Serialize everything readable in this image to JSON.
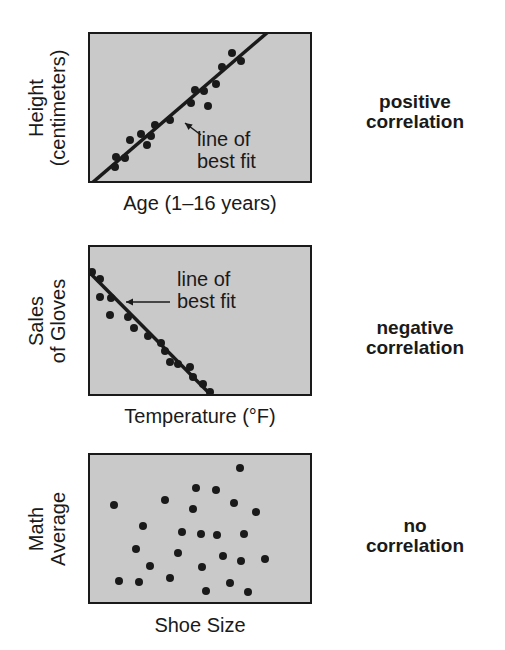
{
  "chart_data": [
    {
      "type": "scatter",
      "title": "positive correlation",
      "xlabel": "Age (1–16 years)",
      "ylabel": "Height (centimeters)",
      "ylabel_lines": [
        "Height",
        "(centimeters)"
      ],
      "grid": false,
      "annotation": {
        "lines": [
          "line of",
          "best fit"
        ],
        "arrow_to": [
          97,
          91
        ]
      },
      "trendline": {
        "x1": 4,
        "y1": 151,
        "x2": 180,
        "y2": 0
      },
      "points_px": [
        [
          27,
          135
        ],
        [
          28,
          125
        ],
        [
          37,
          126
        ],
        [
          42,
          108
        ],
        [
          53,
          102
        ],
        [
          59,
          113
        ],
        [
          63,
          104
        ],
        [
          67,
          93
        ],
        [
          82,
          88
        ],
        [
          103,
          71
        ],
        [
          107,
          58
        ],
        [
          116,
          59
        ],
        [
          120,
          74
        ],
        [
          128,
          52
        ],
        [
          134,
          35
        ],
        [
          144,
          21
        ],
        [
          153,
          29
        ]
      ],
      "plot_px_size": [
        224,
        151
      ]
    },
    {
      "type": "scatter",
      "title": "negative correlation",
      "xlabel": "Temperature (°F)",
      "ylabel": "Sales of Gloves",
      "ylabel_lines": [
        "Sales",
        "of Gloves"
      ],
      "grid": false,
      "annotation": {
        "lines": [
          "line of",
          "best fit"
        ],
        "arrow_to": [
          38,
          57
        ]
      },
      "trendline": {
        "x1": 0,
        "y1": 26,
        "x2": 124,
        "y2": 151
      },
      "points_px": [
        [
          4,
          27
        ],
        [
          12,
          34
        ],
        [
          12,
          52
        ],
        [
          23,
          53
        ],
        [
          22,
          70
        ],
        [
          40,
          72
        ],
        [
          46,
          83
        ],
        [
          60,
          91
        ],
        [
          73,
          98
        ],
        [
          77,
          106
        ],
        [
          82,
          117
        ],
        [
          90,
          119
        ],
        [
          102,
          122
        ],
        [
          105,
          132
        ],
        [
          115,
          139
        ],
        [
          122,
          147
        ]
      ],
      "plot_px_size": [
        224,
        151
      ]
    },
    {
      "type": "scatter",
      "title": "no correlation",
      "xlabel": "Shoe Size",
      "ylabel": "Math Average",
      "ylabel_lines": [
        "Math",
        "Average"
      ],
      "grid": false,
      "points_px": [
        [
          152,
          15
        ],
        [
          108,
          35
        ],
        [
          128,
          37
        ],
        [
          77,
          47
        ],
        [
          26,
          52
        ],
        [
          146,
          50
        ],
        [
          105,
          56
        ],
        [
          168,
          59
        ],
        [
          55,
          73
        ],
        [
          94,
          79
        ],
        [
          113,
          81
        ],
        [
          129,
          82
        ],
        [
          156,
          81
        ],
        [
          48,
          96
        ],
        [
          90,
          100
        ],
        [
          135,
          103
        ],
        [
          153,
          108
        ],
        [
          177,
          106
        ],
        [
          62,
          113
        ],
        [
          114,
          114
        ],
        [
          31,
          128
        ],
        [
          51,
          129
        ],
        [
          82,
          125
        ],
        [
          142,
          130
        ],
        [
          118,
          138
        ],
        [
          160,
          139
        ]
      ],
      "plot_px_size": [
        224,
        151
      ]
    }
  ],
  "panels": {
    "positive": {
      "ylabel_1": "Height",
      "ylabel_2": "(centimeters)",
      "xlabel": "Age (1–16 years)",
      "annot_1": "line of",
      "annot_2": "best fit",
      "corr_1": "positive",
      "corr_2": "correlation"
    },
    "negative": {
      "ylabel_1": "Sales",
      "ylabel_2": "of Gloves",
      "xlabel": "Temperature (°F)",
      "annot_1": "line of",
      "annot_2": "best fit",
      "corr_1": "negative",
      "corr_2": "correlation"
    },
    "none": {
      "ylabel_1": "Math",
      "ylabel_2": "Average",
      "xlabel": "Shoe Size",
      "corr_1": "no",
      "corr_2": "correlation"
    }
  },
  "colors": {
    "plot_bg": "#c9c9c9",
    "ink": "#1a1a1a"
  }
}
